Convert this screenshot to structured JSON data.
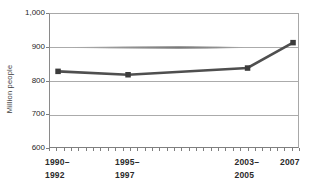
{
  "chart_data": {
    "type": "line",
    "title": "",
    "xlabel": "",
    "ylabel": "Million people",
    "categories": [
      "1990–1992",
      "1995–1997",
      "2003–2005",
      "2007"
    ],
    "values": [
      830,
      820,
      840,
      915
    ],
    "ylim": [
      600,
      1000
    ],
    "yticks": [
      600,
      700,
      800,
      900,
      1000
    ],
    "ytick_labels": [
      "600",
      "700",
      "800",
      "900",
      "1,000"
    ],
    "xtick_label_lines": [
      [
        "1990–",
        "1992"
      ],
      [
        "1995–",
        "1997"
      ],
      [
        "2003–",
        "2005"
      ],
      [
        "2007"
      ]
    ],
    "x_positions_frac": [
      0.032,
      0.312,
      0.79,
      0.972
    ],
    "grid": true,
    "legend": "none",
    "marker": "square",
    "colors": {
      "line": "#4f4f4f",
      "marker": "#3c3c3c",
      "grid": "#ababab",
      "border": "#a8a8a8",
      "tick": "#7f7f7f",
      "xlabel_text": "#2b2b2b",
      "ytick_text": "#1f1f1f",
      "background": "#ffffff"
    }
  }
}
